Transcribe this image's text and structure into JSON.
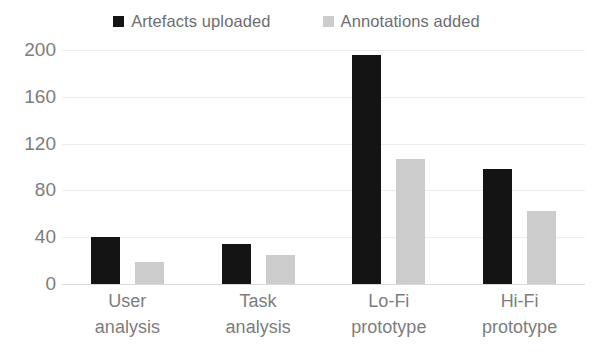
{
  "chart_data": {
    "type": "bar",
    "title": "",
    "subtitle": "",
    "xlabel": "",
    "ylabel": "",
    "categories": [
      "User analysis",
      "Task analysis",
      "Lo-Fi prototype",
      "Hi-Fi prototype"
    ],
    "category_lines": [
      [
        "User",
        "analysis"
      ],
      [
        "Task",
        "analysis"
      ],
      [
        "Lo-Fi",
        "prototype"
      ],
      [
        "Hi-Fi",
        "prototype"
      ]
    ],
    "series": [
      {
        "name": "Artefacts uploaded",
        "color": "#141414",
        "values": [
          40,
          34,
          196,
          98
        ]
      },
      {
        "name": "Annotations added",
        "color": "#cccccc",
        "values": [
          19,
          25,
          107,
          62
        ]
      }
    ],
    "ylim": [
      0,
      200
    ],
    "yticks": [
      0,
      40,
      80,
      120,
      160,
      200
    ],
    "ytick_labels": [
      "0",
      "40",
      "80",
      "120",
      "160",
      "200"
    ],
    "grid": true,
    "grid_color": "#ededed",
    "legend_position": "top-center",
    "axis_text_color": "#7d7d7d"
  },
  "legend": {
    "entries": [
      {
        "label": "Artefacts uploaded",
        "swatch": "#141414"
      },
      {
        "label": "Annotations added",
        "swatch": "#cccccc"
      }
    ]
  }
}
